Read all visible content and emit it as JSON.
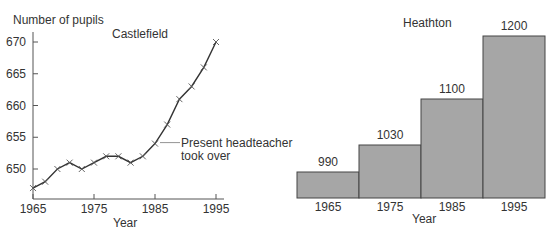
{
  "chart_data": [
    {
      "type": "line",
      "title": "Castlefield",
      "xlabel": "Year",
      "ylabel": "Number of pupils",
      "x_ticks": [
        "1965",
        "1975",
        "1985",
        "1995"
      ],
      "y_ticks": [
        "650",
        "655",
        "660",
        "665",
        "670"
      ],
      "xlim": [
        1965,
        1996
      ],
      "ylim": [
        645.5,
        671
      ],
      "grid": false,
      "marker": "x",
      "x": [
        1965,
        1967,
        1969,
        1971,
        1973,
        1975,
        1977,
        1979,
        1981,
        1983,
        1985,
        1987,
        1989,
        1991,
        1993,
        1995
      ],
      "values": [
        647,
        648,
        650,
        651,
        650,
        651,
        652,
        652,
        651,
        652,
        654,
        657,
        661,
        663,
        666,
        670
      ],
      "annotations": [
        {
          "text_line1": "Present headteacher",
          "text_line2": "took over",
          "x": 1985,
          "y": 654
        }
      ]
    },
    {
      "type": "bar",
      "title": "Heathton",
      "xlabel": "Year",
      "ylabel": "",
      "categories": [
        "1965",
        "1975",
        "1985",
        "1995"
      ],
      "values": [
        990,
        1030,
        1100,
        1200
      ],
      "data_labels": [
        "990",
        "1030",
        "1100",
        "1200"
      ],
      "bar_color": "#a6a6a6",
      "grid": false
    }
  ]
}
